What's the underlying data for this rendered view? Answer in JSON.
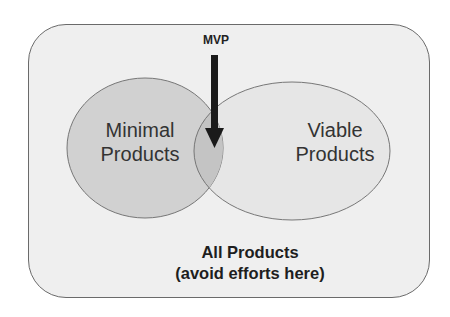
{
  "diagram": {
    "type": "venn",
    "outer_set": {
      "label_line1": "All Products",
      "label_line2": "(avoid efforts here)"
    },
    "sets": [
      {
        "label_line1": "Minimal",
        "label_line2": "Products",
        "fill": "#cfcfcf"
      },
      {
        "label_line1": "Viable",
        "label_line2": "Products",
        "fill": "#e6e6e6"
      }
    ],
    "intersection": {
      "label": "MVP",
      "pointer": "arrow-down"
    },
    "colors": {
      "outer_fill": "#efefef",
      "border": "#6a6a6a",
      "arrow": "#1a1a1a"
    }
  }
}
